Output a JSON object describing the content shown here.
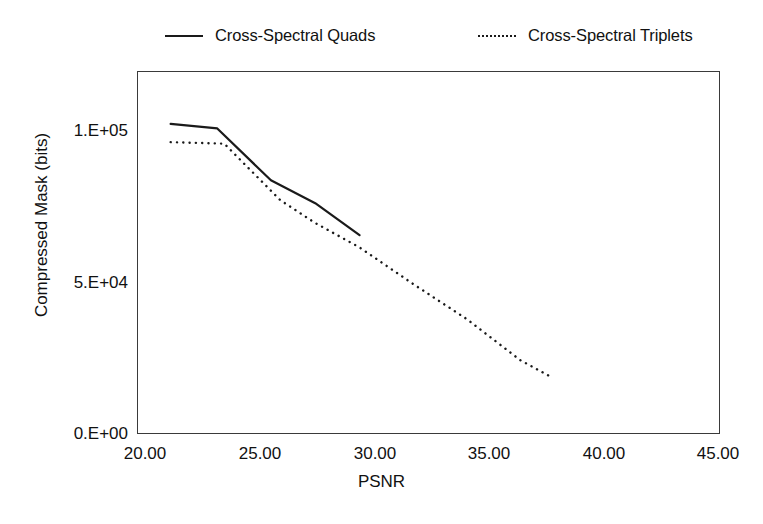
{
  "chart_data": {
    "type": "line",
    "title": "",
    "subtitle": "",
    "xlabel": "PSNR",
    "ylabel": "Compressed Mask (bits)",
    "xlim": [
      20.0,
      45.0
    ],
    "ylim": [
      0,
      119000
    ],
    "xticks": [
      "20.00",
      "25.00",
      "30.00",
      "35.00",
      "40.00",
      "45.00"
    ],
    "xtick_values": [
      20.0,
      25.0,
      30.0,
      35.0,
      40.0,
      45.0
    ],
    "yticks": [
      "0.E+00",
      "5.E+04",
      "1.E+05"
    ],
    "ytick_values": [
      0,
      50000,
      100000
    ],
    "grid": false,
    "legend_position": "top",
    "series": [
      {
        "name": "Cross-Spectral Quads",
        "style": "solid",
        "color": "#1a1a1a",
        "x": [
          21.4,
          23.4,
          25.7,
          27.6,
          29.5
        ],
        "y": [
          102000,
          100500,
          83500,
          76000,
          65500
        ]
      },
      {
        "name": "Cross-Spectral Triplets",
        "style": "dotted",
        "color": "#1a1a1a",
        "x": [
          21.4,
          23.7,
          26.1,
          27.6,
          29.5,
          31.8,
          34.1,
          36.4,
          37.6
        ],
        "y": [
          96000,
          95500,
          77000,
          69500,
          61500,
          49500,
          38000,
          24500,
          19500
        ]
      }
    ]
  },
  "legend": {
    "entries": [
      {
        "label": "Cross-Spectral Quads",
        "style": "solid"
      },
      {
        "label": "Cross-Spectral Triplets",
        "style": "dotted"
      }
    ]
  },
  "axes": {
    "x_title": "PSNR",
    "y_title": "Compressed Mask (bits)",
    "x_tick_labels": [
      "20.00",
      "25.00",
      "30.00",
      "35.00",
      "40.00",
      "45.00"
    ],
    "y_tick_labels": [
      "0.E+00",
      "5.E+04",
      "1.E+05"
    ]
  }
}
